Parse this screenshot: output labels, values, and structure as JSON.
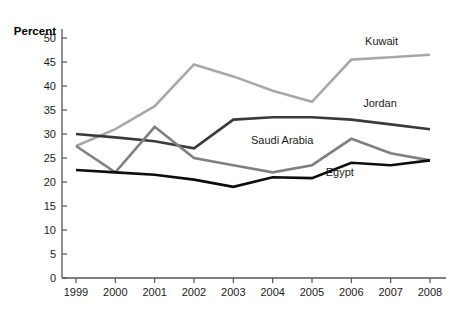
{
  "chart_data": {
    "type": "line",
    "title": "",
    "subtitle": "",
    "xlabel": "",
    "ylabel": "Percent",
    "x": [
      1999,
      2000,
      2001,
      2002,
      2003,
      2004,
      2005,
      2006,
      2007,
      2008
    ],
    "x_tick_labels": [
      "1999",
      "2000",
      "2001",
      "2002",
      "2003",
      "2004",
      "2005",
      "2006",
      "2007",
      "2008"
    ],
    "y_tick_labels": [
      "0",
      "5",
      "10",
      "15",
      "20",
      "25",
      "30",
      "35",
      "40",
      "45",
      "50"
    ],
    "y_ticks": [
      0,
      5,
      10,
      15,
      20,
      25,
      30,
      35,
      40,
      45,
      50
    ],
    "ylim": [
      0,
      50
    ],
    "xlim": [
      1999,
      2008
    ],
    "grid": false,
    "legend_position": "inline-end-of-line",
    "series": [
      {
        "name": "Kuwait",
        "color": "#a8a8a8",
        "width": 2.6,
        "values": [
          27.5,
          31.0,
          35.8,
          44.5,
          42.0,
          39.0,
          36.7,
          45.5,
          46.0,
          46.5
        ],
        "label": "Kuwait",
        "label_x": 2006.35,
        "label_y": 48.6
      },
      {
        "name": "Jordan",
        "color": "#3a3a3a",
        "width": 2.6,
        "values": [
          30.0,
          29.3,
          28.5,
          27.0,
          33.0,
          33.5,
          33.5,
          33.0,
          32.0,
          31.0
        ],
        "label": "Jordan",
        "label_x": 2006.3,
        "label_y": 35.6
      },
      {
        "name": "Saudi Arabia",
        "color": "#808080",
        "width": 2.6,
        "values": [
          27.5,
          22.0,
          31.5,
          25.0,
          23.5,
          22.0,
          23.5,
          29.0,
          26.0,
          24.5
        ],
        "label": "Saudi Arabia",
        "label_x": 2003.45,
        "label_y": 28.0
      },
      {
        "name": "Egypt",
        "color": "#0d0d0d",
        "width": 2.6,
        "values": [
          22.5,
          22.0,
          21.5,
          20.5,
          19.0,
          21.0,
          20.8,
          24.0,
          23.5,
          24.5
        ],
        "label": "Egypt",
        "label_x": 2005.35,
        "label_y": 21.2
      }
    ]
  },
  "axis": {
    "y_title": "Percent",
    "axis_color": "#555555"
  }
}
